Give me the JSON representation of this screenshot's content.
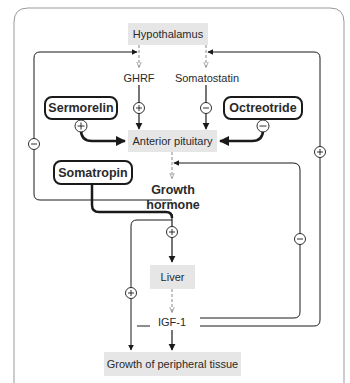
{
  "diagram": {
    "nodes": {
      "hypothalamus": "Hypothalamus",
      "ghrf": "GHRF",
      "somatostatin": "Somatostatin",
      "sermorelin": "Sermorelin",
      "octreotide": "Octreotride",
      "anterior_pituitary": "Anterior pituitary",
      "somatropin": "Somatropin",
      "growth_hormone_line1": "Growth",
      "growth_hormone_line2": "hormone",
      "liver": "Liver",
      "igf1": "IGF-1",
      "peripheral": "Growth of peripheral tissue"
    },
    "signs": {
      "plus": "+",
      "minus": "−"
    },
    "edges": [
      {
        "from": "Hypothalamus",
        "to": "GHRF",
        "style": "dashed"
      },
      {
        "from": "Hypothalamus",
        "to": "Somatostatin",
        "style": "dashed"
      },
      {
        "from": "GHRF",
        "to": "Anterior pituitary",
        "sign": "+"
      },
      {
        "from": "Somatostatin",
        "to": "Anterior pituitary",
        "sign": "−"
      },
      {
        "from": "Sermorelin",
        "to": "Anterior pituitary",
        "sign": "+"
      },
      {
        "from": "Octreotride",
        "to": "Anterior pituitary",
        "sign": "−"
      },
      {
        "from": "Anterior pituitary",
        "to": "Growth hormone",
        "style": "dashed"
      },
      {
        "from": "Somatropin",
        "to": "Growth hormone pathway"
      },
      {
        "from": "Growth hormone",
        "to": "Hypothalamus",
        "sign": "−"
      },
      {
        "from": "Growth hormone",
        "to": "Liver",
        "sign": "+"
      },
      {
        "from": "Growth hormone",
        "to": "Growth of peripheral tissue",
        "sign": "+"
      },
      {
        "from": "Liver",
        "to": "IGF-1",
        "style": "dashed"
      },
      {
        "from": "IGF-1",
        "to": "Growth of peripheral tissue"
      },
      {
        "from": "IGF-1",
        "to": "Anterior pituitary",
        "sign": "−"
      },
      {
        "from": "IGF-1",
        "to": "Hypothalamus",
        "sign": "+"
      }
    ]
  }
}
